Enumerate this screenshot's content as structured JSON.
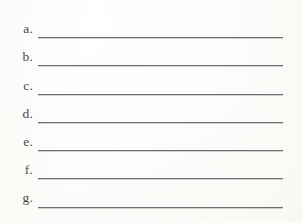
{
  "document": {
    "type": "worksheet-answer-lines",
    "background_color": "#fdfdfb",
    "rule_color": "#6d6d6d",
    "text_color": "#4a4a4a",
    "rows": [
      {
        "label": "a.",
        "value": ""
      },
      {
        "label": "b.",
        "value": ""
      },
      {
        "label": "c.",
        "value": ""
      },
      {
        "label": "d.",
        "value": ""
      },
      {
        "label": "e.",
        "value": ""
      },
      {
        "label": "f.",
        "value": ""
      },
      {
        "label": "g.",
        "value": ""
      }
    ]
  }
}
